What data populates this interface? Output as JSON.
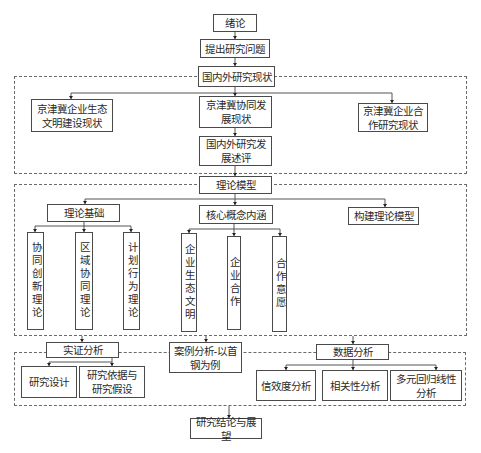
{
  "diagram": {
    "type": "research-framework-flowchart",
    "nodes": {
      "intro": "绪论",
      "problem": "提出研究问题",
      "status": "国内外研究现状",
      "status_eco": "京津冀企业生态文明建设现状",
      "status_coop_dev": "京津冀协同发展现状",
      "status_enterprise_coop": "京津冀企业合作研究现状",
      "review": "国内外研究发展述评",
      "theory_model": "理论模型",
      "theory_basis": "理论基础",
      "core_concepts": "核心概念内涵",
      "build_model": "构建理论模型",
      "theory_1": "协同创新理论",
      "theory_2": "区域协同理论",
      "theory_3": "计划行为理论",
      "concept_1": "企业生态文明",
      "concept_2": "企业合作",
      "concept_3": "合作意愿",
      "empirical": "实证分析",
      "case": "案例分析-以首钢为例",
      "data_analysis": "数据分析",
      "design": "研究设计",
      "basis_hypothesis": "研究依据与研究假设",
      "reliability": "信效度分析",
      "correlation": "相关性分析",
      "regression": "多元回归线性分析",
      "conclusion": "研究结论与展望"
    },
    "labels_display": {
      "status_eco": "京津冀企业生态\n文明建设现状",
      "status_coop_dev": "京津冀协同发\n展现状",
      "status_enterprise_coop": "京津冀企业合\n作研究现状",
      "review": "国内外研究发\n展述评",
      "case": "案例分析-以首\n钢为例",
      "basis_hypothesis": "研究依据与\n研究假设",
      "regression": "多元回归线性\n分析"
    },
    "edges": [
      [
        "intro",
        "problem"
      ],
      [
        "problem",
        "status"
      ],
      [
        "status",
        "status_eco"
      ],
      [
        "status",
        "status_coop_dev"
      ],
      [
        "status",
        "status_enterprise_coop"
      ],
      [
        "status_coop_dev",
        "review"
      ],
      [
        "review",
        "theory_model"
      ],
      [
        "theory_model",
        "theory_basis"
      ],
      [
        "theory_model",
        "core_concepts"
      ],
      [
        "theory_model",
        "build_model"
      ],
      [
        "theory_basis",
        "theory_1"
      ],
      [
        "theory_basis",
        "theory_2"
      ],
      [
        "theory_basis",
        "theory_3"
      ],
      [
        "core_concepts",
        "concept_1"
      ],
      [
        "core_concepts",
        "concept_2"
      ],
      [
        "core_concepts",
        "concept_3"
      ],
      [
        "theory_model",
        "empirical"
      ],
      [
        "theory_model",
        "case"
      ],
      [
        "theory_model",
        "data_analysis"
      ],
      [
        "empirical",
        "design"
      ],
      [
        "empirical",
        "basis_hypothesis"
      ],
      [
        "data_analysis",
        "reliability"
      ],
      [
        "data_analysis",
        "correlation"
      ],
      [
        "data_analysis",
        "regression"
      ],
      [
        "analysis_group",
        "conclusion"
      ]
    ],
    "groups": [
      {
        "name": "research-status-group",
        "contains": [
          "status_eco",
          "status_coop_dev",
          "status_enterprise_coop",
          "review"
        ]
      },
      {
        "name": "theory-model-group",
        "contains": [
          "theory_basis",
          "core_concepts",
          "build_model",
          "theory_1",
          "theory_2",
          "theory_3",
          "concept_1",
          "concept_2",
          "concept_3"
        ]
      },
      {
        "name": "analysis-group",
        "contains": [
          "empirical",
          "case",
          "data_analysis",
          "design",
          "basis_hypothesis",
          "reliability",
          "correlation",
          "regression"
        ]
      }
    ]
  }
}
